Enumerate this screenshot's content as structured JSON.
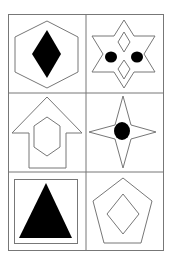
{
  "puzzle": {
    "type": "figure-reasoning-grid",
    "rows": 3,
    "cols": 2,
    "line_color": "#777777",
    "fill_color": "#000000",
    "cells": [
      {
        "row": 0,
        "col": 0,
        "outer": "hexagon",
        "inner": "filled-diamond"
      },
      {
        "row": 0,
        "col": 1,
        "outer": "six-pointed-star",
        "inner": "two-diamonds-and-two-dots"
      },
      {
        "row": 1,
        "col": 0,
        "outer": "arrow-up",
        "inner": "hexagon"
      },
      {
        "row": 1,
        "col": 1,
        "outer": "four-pointed-star",
        "inner": "filled-circle"
      },
      {
        "row": 2,
        "col": 0,
        "outer": "square",
        "inner": "filled-triangle"
      },
      {
        "row": 2,
        "col": 1,
        "outer": "pentagon",
        "inner": "diamond"
      }
    ]
  }
}
